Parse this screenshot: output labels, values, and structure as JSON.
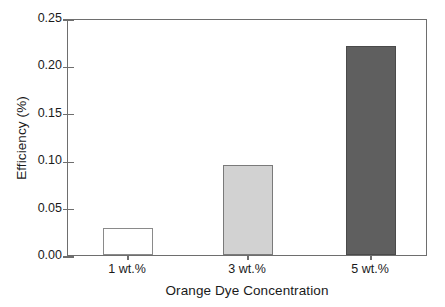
{
  "chart_data": {
    "type": "bar",
    "title": "",
    "subtitle": "",
    "categories": [
      "1 wt.%",
      "3 wt.%",
      "5 wt.%"
    ],
    "values": [
      0.028,
      0.095,
      0.22
    ],
    "xlabel": "Orange Dye Concentration",
    "ylabel": "Efficiency (%)",
    "ylim": [
      0.0,
      0.25
    ],
    "ytick_labels": [
      "0.25",
      "0.20",
      "0.15",
      "0.10",
      "0.05",
      "0.00"
    ],
    "ytick_values": [
      0.25,
      0.2,
      0.15,
      0.1,
      0.05,
      0.0
    ],
    "ytick_step": 0.05,
    "grid": false,
    "legend": null,
    "legend_position": "none",
    "annotations": [],
    "bar_styles": [
      {
        "fill": "#ffffff",
        "edge": "#8a8a8a"
      },
      {
        "fill": "#d2d2d2",
        "edge": "#7a7a7a"
      },
      {
        "fill": "#5f5f5f",
        "edge": "#4a4a4a"
      }
    ],
    "axis_color": "#6e6e6e",
    "text_color": "#1a1a1a",
    "background": "#ffffff"
  },
  "axes": {
    "y_title": "Efficiency (%)",
    "x_title": "Orange Dye Concentration"
  }
}
